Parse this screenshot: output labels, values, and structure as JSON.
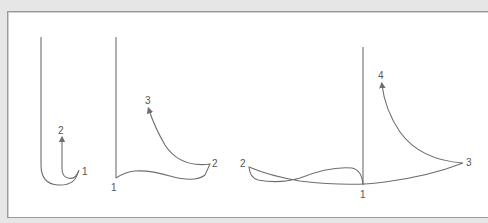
{
  "diagram": {
    "panels": [
      {
        "id": "figure-a",
        "labels": {
          "p1": "1",
          "p2": "2"
        }
      },
      {
        "id": "figure-b",
        "labels": {
          "p1": "1",
          "p2": "2",
          "p3": "3"
        }
      },
      {
        "id": "figure-c",
        "labels": {
          "p1": "1",
          "p2": "2",
          "p3": "3",
          "p4": "4"
        }
      }
    ],
    "colors": {
      "stroke": "#6e6e6e",
      "background": "#ffffff",
      "frame": "#e6e6e6"
    }
  }
}
